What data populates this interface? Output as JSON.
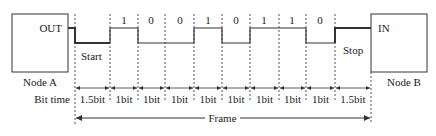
{
  "node_a": {
    "port_label": "OUT",
    "name": "Node A"
  },
  "node_b": {
    "port_label": "IN",
    "name": "Node B"
  },
  "start_label": "Start",
  "stop_label": "Stop",
  "data_bits": [
    "1",
    "0",
    "0",
    "1",
    "0",
    "1",
    "1",
    "0"
  ],
  "bit_time_label": "Bit time",
  "bit_times": [
    "1.5bit",
    "1bit",
    "1bit",
    "1bit",
    "1bit",
    "1bit",
    "1bit",
    "1bit",
    "1bit",
    "1.5bit"
  ],
  "frame_label": "Frame",
  "colors": {
    "line": "#333333",
    "text": "#222222",
    "dash": "#555555"
  }
}
